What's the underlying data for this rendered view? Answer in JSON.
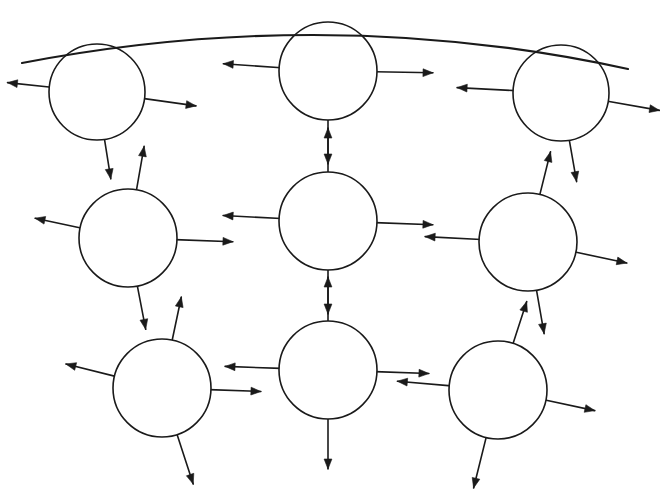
{
  "figure": {
    "width": 660,
    "height": 496,
    "background_color": "#ffffff",
    "stroke_color": "#1a1a1a"
  },
  "boundary_arc": {
    "name": "top-boundary-arc",
    "start": [
      22,
      63
    ],
    "control": [
      330,
      4
    ],
    "end": [
      628,
      69
    ],
    "stroke_width": 2.1
  },
  "nodes": [
    {
      "id": "node-top-left",
      "label": "top-left",
      "row": 1,
      "column": 1,
      "cx": 97,
      "cy": 92,
      "r": 48,
      "arrows": [
        {
          "name": "arrow-right",
          "angle": 8,
          "length": 52,
          "direction": "outward"
        },
        {
          "name": "arrow-left-down",
          "angle": 186,
          "length": 42,
          "direction": "outward"
        },
        {
          "name": "arrow-down",
          "angle": 81,
          "length": 40,
          "direction": "outward"
        }
      ]
    },
    {
      "id": "node-top-center",
      "label": "top-center",
      "row": 1,
      "column": 2,
      "cx": 328,
      "cy": 71,
      "r": 49,
      "arrows": [
        {
          "name": "arrow-left",
          "angle": 184,
          "length": 56,
          "direction": "outward"
        },
        {
          "name": "arrow-right",
          "angle": 1,
          "length": 56,
          "direction": "outward"
        },
        {
          "name": "arrow-down",
          "angle": 90,
          "length": 44,
          "direction": "outward"
        }
      ]
    },
    {
      "id": "node-top-right",
      "label": "top-right",
      "row": 1,
      "column": 3,
      "cx": 561,
      "cy": 93,
      "r": 48,
      "arrows": [
        {
          "name": "arrow-left",
          "angle": 183,
          "length": 56,
          "direction": "outward"
        },
        {
          "name": "arrow-right-down",
          "angle": 10,
          "length": 52,
          "direction": "outward"
        },
        {
          "name": "arrow-down",
          "angle": 80,
          "length": 42,
          "direction": "outward"
        }
      ]
    },
    {
      "id": "node-middle-left",
      "label": "middle-left",
      "row": 2,
      "column": 1,
      "cx": 128,
      "cy": 238,
      "r": 49,
      "arrows": [
        {
          "name": "arrow-up",
          "angle": -80,
          "length": 44,
          "direction": "outward"
        },
        {
          "name": "arrow-right",
          "angle": 2,
          "length": 56,
          "direction": "outward"
        },
        {
          "name": "arrow-left-down",
          "angle": 192,
          "length": 46,
          "direction": "outward"
        },
        {
          "name": "arrow-down",
          "angle": 79,
          "length": 44,
          "direction": "outward"
        }
      ]
    },
    {
      "id": "node-middle-center",
      "label": "middle-center",
      "row": 2,
      "column": 2,
      "cx": 328,
      "cy": 221,
      "r": 49,
      "arrows": [
        {
          "name": "arrow-up",
          "angle": -90,
          "length": 44,
          "direction": "outward"
        },
        {
          "name": "arrow-right",
          "angle": 2,
          "length": 56,
          "direction": "outward"
        },
        {
          "name": "arrow-left",
          "angle": 183,
          "length": 56,
          "direction": "outward"
        },
        {
          "name": "arrow-down",
          "angle": 90,
          "length": 44,
          "direction": "outward"
        }
      ]
    },
    {
      "id": "node-middle-right",
      "label": "middle-right",
      "row": 2,
      "column": 3,
      "cx": 528,
      "cy": 242,
      "r": 49,
      "arrows": [
        {
          "name": "arrow-up-right",
          "angle": -76,
          "length": 44,
          "direction": "outward"
        },
        {
          "name": "arrow-right-down",
          "angle": 12,
          "length": 52,
          "direction": "outward"
        },
        {
          "name": "arrow-left",
          "angle": 183,
          "length": 54,
          "direction": "outward"
        },
        {
          "name": "arrow-down",
          "angle": 80,
          "length": 44,
          "direction": "outward"
        }
      ]
    },
    {
      "id": "node-bottom-left",
      "label": "bottom-left",
      "row": 3,
      "column": 1,
      "cx": 162,
      "cy": 388,
      "r": 49,
      "arrows": [
        {
          "name": "arrow-up-right",
          "angle": -78,
          "length": 44,
          "direction": "outward"
        },
        {
          "name": "arrow-right",
          "angle": 2,
          "length": 50,
          "direction": "outward"
        },
        {
          "name": "arrow-left-up",
          "angle": 194,
          "length": 50,
          "direction": "outward"
        },
        {
          "name": "arrow-down-right",
          "angle": 72,
          "length": 52,
          "direction": "outward"
        }
      ]
    },
    {
      "id": "node-bottom-center",
      "label": "bottom-center",
      "row": 3,
      "column": 2,
      "cx": 328,
      "cy": 370,
      "r": 49,
      "arrows": [
        {
          "name": "arrow-up",
          "angle": -90,
          "length": 44,
          "direction": "outward"
        },
        {
          "name": "arrow-right",
          "angle": 2,
          "length": 52,
          "direction": "outward"
        },
        {
          "name": "arrow-left",
          "angle": 182,
          "length": 54,
          "direction": "outward"
        },
        {
          "name": "arrow-down",
          "angle": 90,
          "length": 50,
          "direction": "outward"
        }
      ]
    },
    {
      "id": "node-bottom-right",
      "label": "bottom-right",
      "row": 3,
      "column": 3,
      "cx": 498,
      "cy": 390,
      "r": 49,
      "arrows": [
        {
          "name": "arrow-up-right",
          "angle": -72,
          "length": 44,
          "direction": "outward"
        },
        {
          "name": "arrow-right-down",
          "angle": 12,
          "length": 50,
          "direction": "outward"
        },
        {
          "name": "arrow-left",
          "angle": 185,
          "length": 52,
          "direction": "outward"
        },
        {
          "name": "arrow-down-left",
          "angle": 104,
          "length": 52,
          "direction": "outward"
        }
      ]
    }
  ]
}
